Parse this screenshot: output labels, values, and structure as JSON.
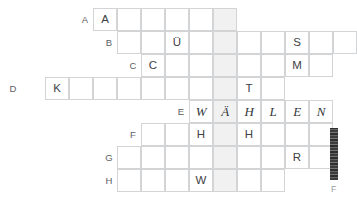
{
  "puzzle": {
    "type": "crossword-grid",
    "solved_answer": "WÄHLEN",
    "geometry": {
      "cell_width": 24,
      "cell_height": 23,
      "origin_x": 21,
      "origin_y": 8,
      "highlight_column_index": 8,
      "highlight_color": "#f1f1f1",
      "grid_line_color": "#d2d4d6",
      "label_color": "#5c6166",
      "letter_color": "#3c4144"
    },
    "rows": [
      {
        "label": "A",
        "label_x": 78,
        "start_col": 3,
        "cell_count": 6,
        "truncated_right": false,
        "letters": [
          {
            "col_offset": 0,
            "text": "A",
            "hand": false
          }
        ]
      },
      {
        "label": "B",
        "label_x": 102,
        "start_col": 4,
        "cell_count": 10,
        "truncated_right": true,
        "letters": [
          {
            "col_offset": 2,
            "text": "Ü",
            "hand": false
          },
          {
            "col_offset": 7,
            "text": "S",
            "hand": false
          }
        ]
      },
      {
        "label": "C",
        "label_x": 126,
        "start_col": 5,
        "cell_count": 8,
        "truncated_right": false,
        "letters": [
          {
            "col_offset": 0,
            "text": "C",
            "hand": false
          },
          {
            "col_offset": 6,
            "text": "M",
            "hand": false
          }
        ]
      },
      {
        "label": "D",
        "label_x": 6,
        "start_col": 1,
        "cell_count": 10,
        "truncated_right": false,
        "letters": [
          {
            "col_offset": 0,
            "text": "K",
            "hand": false
          },
          {
            "col_offset": 8,
            "text": "T",
            "hand": false
          }
        ]
      },
      {
        "label": "E",
        "label_x": 174,
        "start_col": 7,
        "cell_count": 6,
        "truncated_right": false,
        "letters": [
          {
            "col_offset": 0,
            "text": "W",
            "hand": true
          },
          {
            "col_offset": 1,
            "text": "Ä",
            "hand": true
          },
          {
            "col_offset": 2,
            "text": "H",
            "hand": true
          },
          {
            "col_offset": 3,
            "text": "L",
            "hand": true
          },
          {
            "col_offset": 4,
            "text": "E",
            "hand": true
          },
          {
            "col_offset": 5,
            "text": "N",
            "hand": true
          }
        ]
      },
      {
        "label": "F",
        "label_x": 126,
        "start_col": 5,
        "cell_count": 8,
        "truncated_right": false,
        "letters": [
          {
            "col_offset": 2,
            "text": "H",
            "hand": false
          },
          {
            "col_offset": 4,
            "text": "H",
            "hand": false
          }
        ]
      },
      {
        "label": "G",
        "label_x": 102,
        "start_col": 4,
        "cell_count": 9,
        "truncated_right": false,
        "letters": [
          {
            "col_offset": 7,
            "text": "R",
            "hand": false
          }
        ]
      },
      {
        "label": "H",
        "label_x": 102,
        "start_col": 4,
        "cell_count": 7,
        "truncated_right": false,
        "letters": [
          {
            "col_offset": 3,
            "text": "W",
            "hand": false
          }
        ]
      }
    ],
    "edge_artifact": {
      "x": 330,
      "y": 128,
      "width": 8,
      "height": 52,
      "glyph": "F",
      "glyph_x": 331,
      "glyph_y": 184
    }
  }
}
